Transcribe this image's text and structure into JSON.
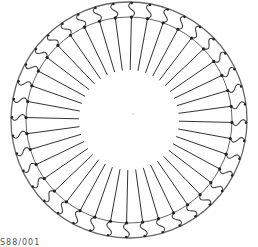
{
  "diagram": {
    "type": "radial-spoke-ring",
    "center": [
      129,
      120
    ],
    "outer_radius": 118,
    "ring_radius": 103,
    "inner_radius": 50,
    "spoke_count": 40,
    "stroke_color": "#333333",
    "ring_color": "#666666",
    "connector_color": "#444444",
    "node_color": "#222222"
  },
  "caption": "S88/001"
}
